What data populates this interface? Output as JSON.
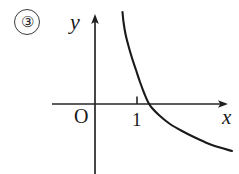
{
  "figure": {
    "item_number": "③",
    "background_color": "#ffffff",
    "ink_color": "#1a1a1a",
    "width": 239,
    "height": 174
  },
  "labels": {
    "y_axis": "y",
    "x_axis": "x",
    "origin": "O",
    "tick_one": "1"
  },
  "chart_data": {
    "type": "line",
    "title": "",
    "xlabel": "x",
    "ylabel": "y",
    "grid": false,
    "legend": null,
    "annotations": [
      "③"
    ],
    "axes": {
      "origin_label": "O",
      "origin_px": [
        95,
        104
      ],
      "x_axis_y_px": 104,
      "y_axis_x_px": 95,
      "x_axis_from_px": 52,
      "x_axis_to_px": 228,
      "y_axis_from_px": 14,
      "y_axis_to_px": 174,
      "x_arrow": true,
      "y_arrow": true,
      "x_ticks": [
        {
          "label": "1",
          "x_px": 137
        }
      ],
      "y_ticks": []
    },
    "series": [
      {
        "name": "decreasing-convex-curve",
        "description": "Decreasing convex curve, steeply falling near the y-axis, crossing the x-axis just right of x = 1, then flattening toward the lower right.",
        "stroke": "#1a1a1a",
        "stroke_width": 2.1,
        "points_px": [
          [
            122.5,
            12
          ],
          [
            123.5,
            22
          ],
          [
            125.5,
            34
          ],
          [
            128.5,
            46
          ],
          [
            132.0,
            58
          ],
          [
            136.0,
            70
          ],
          [
            140.0,
            82
          ],
          [
            144.5,
            94
          ],
          [
            148.0,
            102
          ],
          [
            152.0,
            108
          ],
          [
            160.0,
            116
          ],
          [
            170.0,
            124
          ],
          [
            182.0,
            131
          ],
          [
            196.0,
            138
          ],
          [
            212.0,
            145
          ],
          [
            232.0,
            151
          ]
        ],
        "x_intercept_px": 147
      }
    ]
  }
}
